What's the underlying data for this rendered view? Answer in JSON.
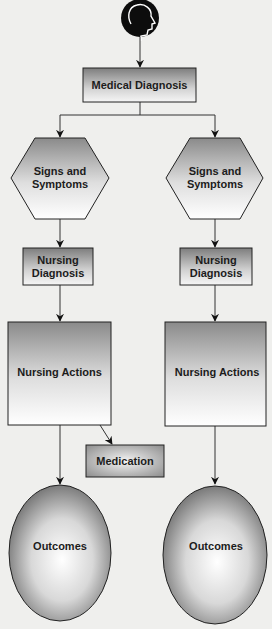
{
  "diagram": {
    "title_icon": "person-head-icon",
    "nodes": {
      "medical_diagnosis": "Medical Diagnosis",
      "left": {
        "signs_line1": "Signs and",
        "signs_line2": "Symptoms",
        "nursing_diag_line1": "Nursing",
        "nursing_diag_line2": "Diagnosis",
        "nursing_actions": "Nursing Actions",
        "medication": "Medication",
        "outcomes": "Outcomes"
      },
      "right": {
        "signs_line1": "Signs and",
        "signs_line2": "Symptoms",
        "nursing_diag_line1": "Nursing",
        "nursing_diag_line2": "Diagnosis",
        "nursing_actions": "Nursing Actions",
        "outcomes": "Outcomes"
      }
    },
    "colors": {
      "background": "#efefed",
      "stroke": "#222222",
      "shape_dark": "#8a8a8a",
      "shape_light": "#ffffff",
      "icon_fill": "#0d0d0d"
    },
    "edges": [
      {
        "from": "person-head-icon",
        "to": "Medical Diagnosis"
      },
      {
        "from": "Medical Diagnosis",
        "to": "Signs and Symptoms (left)"
      },
      {
        "from": "Medical Diagnosis",
        "to": "Signs and Symptoms (right)"
      },
      {
        "from": "Signs and Symptoms (left)",
        "to": "Nursing Diagnosis (left)"
      },
      {
        "from": "Signs and Symptoms (right)",
        "to": "Nursing Diagnosis (right)"
      },
      {
        "from": "Nursing Diagnosis (left)",
        "to": "Nursing Actions (left)"
      },
      {
        "from": "Nursing Diagnosis (right)",
        "to": "Nursing Actions (right)"
      },
      {
        "from": "Nursing Actions (left)",
        "to": "Medication"
      },
      {
        "from": "Nursing Actions (left)",
        "to": "Outcomes (left)"
      },
      {
        "from": "Nursing Actions (right)",
        "to": "Outcomes (right)"
      }
    ]
  }
}
